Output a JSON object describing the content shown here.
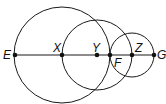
{
  "diagram": {
    "type": "geometry-circles",
    "stroke_color": "#1a1a1a",
    "line": {
      "from": "E",
      "to": "G"
    },
    "points": [
      {
        "id": "E",
        "label": "E",
        "x": 15,
        "y": 55
      },
      {
        "id": "X",
        "label": "X",
        "x": 62,
        "y": 55
      },
      {
        "id": "Y",
        "label": "Y",
        "x": 97,
        "y": 55
      },
      {
        "id": "F",
        "label": "F",
        "x": 110,
        "y": 55
      },
      {
        "id": "Z",
        "label": "Z",
        "x": 132,
        "y": 55
      },
      {
        "id": "G",
        "label": "G",
        "x": 154,
        "y": 55
      }
    ],
    "circles": [
      {
        "center": "X",
        "cx": 62,
        "cy": 55,
        "r": 48
      },
      {
        "center": "Y",
        "cx": 97,
        "cy": 55,
        "r": 35
      },
      {
        "center": "Z",
        "cx": 132,
        "cy": 55,
        "r": 22
      }
    ]
  }
}
